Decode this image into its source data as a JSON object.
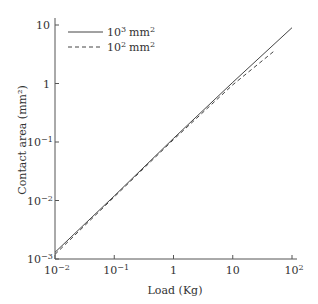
{
  "chart_data": {
    "type": "line",
    "title": "",
    "xlabel": "Load (Kg)",
    "ylabel": "Contact area (mm²)",
    "xscale": "log",
    "yscale": "log",
    "xlim": [
      0.01,
      100
    ],
    "ylim": [
      0.001,
      10
    ],
    "grid": false,
    "legend_position": "upper left",
    "x_ticks": [
      {
        "value": 0.01,
        "base": "10",
        "exp": "−2"
      },
      {
        "value": 0.1,
        "base": "10",
        "exp": "−1"
      },
      {
        "value": 1,
        "base": "1",
        "exp": ""
      },
      {
        "value": 10,
        "base": "10",
        "exp": ""
      },
      {
        "value": 100,
        "base": "10",
        "exp": "2"
      }
    ],
    "y_ticks": [
      {
        "value": 0.001,
        "base": "10",
        "exp": "−3"
      },
      {
        "value": 0.01,
        "base": "10",
        "exp": "−2"
      },
      {
        "value": 0.1,
        "base": "10",
        "exp": "−1"
      },
      {
        "value": 1,
        "base": "1",
        "exp": ""
      },
      {
        "value": 10,
        "base": "10",
        "exp": ""
      }
    ],
    "series": [
      {
        "name": "10³ mm²",
        "legend_base": "10",
        "legend_exp": "3",
        "legend_unit": "mm",
        "legend_unit_exp": "2",
        "style": "solid",
        "x": [
          0.01,
          0.1,
          1,
          10,
          100
        ],
        "y": [
          0.0013,
          0.012,
          0.115,
          1.05,
          9.0
        ]
      },
      {
        "name": "10² mm²",
        "legend_base": "10",
        "legend_exp": "2",
        "legend_unit": "mm",
        "legend_unit_exp": "2",
        "style": "dashed",
        "x": [
          0.01,
          0.1,
          1,
          10,
          50
        ],
        "y": [
          0.0012,
          0.0115,
          0.11,
          0.95,
          3.6
        ]
      }
    ]
  }
}
